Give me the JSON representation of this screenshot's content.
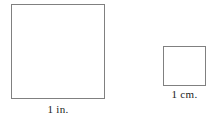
{
  "figure": {
    "background_color": "#ffffff",
    "stroke_color": "#808080",
    "text_color": "#1a1a1a",
    "canvas": {
      "width_px": 213,
      "height_px": 121
    },
    "shapes": [
      {
        "name": "square-inch",
        "unit": "inch",
        "label": "1 in.",
        "side_length_value": 1,
        "side_length_unit": "in.",
        "fill": "#ffffff",
        "stroke": "#808080",
        "bounds_px": {
          "x": 11,
          "y": 4,
          "width": 94,
          "height": 95
        }
      },
      {
        "name": "square-centimeter",
        "unit": "centimeter",
        "label": "1 cm.",
        "side_length_value": 1,
        "side_length_unit": "cm.",
        "fill": "#ffffff",
        "stroke": "#808080",
        "bounds_px": {
          "x": 163,
          "y": 46,
          "width": 43,
          "height": 40
        }
      }
    ]
  }
}
